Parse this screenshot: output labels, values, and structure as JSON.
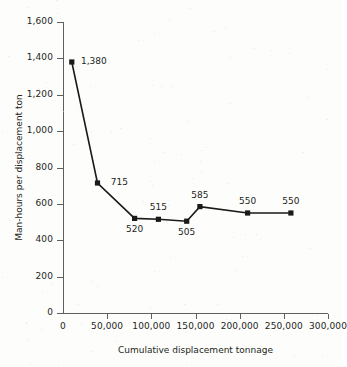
{
  "chart_data": {
    "type": "line",
    "title": "",
    "xlabel": "Cumulative displacement tonnage",
    "ylabel": "Man-hours per displacement ton",
    "xlim": [
      0,
      300000
    ],
    "ylim": [
      0,
      1600
    ],
    "grid": false,
    "legend": null,
    "x": [
      10000,
      39000,
      81000,
      108000,
      140000,
      155000,
      209000,
      258000
    ],
    "values": [
      1380,
      715,
      520,
      515,
      505,
      585,
      550,
      550
    ],
    "point_labels": [
      "1,380",
      "715",
      "520",
      "515",
      "505",
      "585",
      "550",
      "550"
    ],
    "point_label_positions": [
      "right",
      "right",
      "below",
      "above",
      "below",
      "above",
      "above",
      "above"
    ],
    "xticks": [
      0,
      50000,
      100000,
      150000,
      200000,
      250000,
      300000
    ],
    "xtick_labels": [
      "0",
      "50,000",
      "100,000",
      "150,000",
      "200,000",
      "250,000",
      "300,000"
    ],
    "yticks": [
      0,
      200,
      400,
      600,
      800,
      1000,
      1200,
      1400,
      1600
    ],
    "ytick_labels": [
      "0",
      "200",
      "400",
      "600",
      "800",
      "1,000",
      "1,200",
      "1,400",
      "1,600"
    ],
    "marker": "square",
    "marker_color": "#1a1a1a",
    "line_color": "#1a1a1a",
    "background_color": "#fdfdfc"
  }
}
